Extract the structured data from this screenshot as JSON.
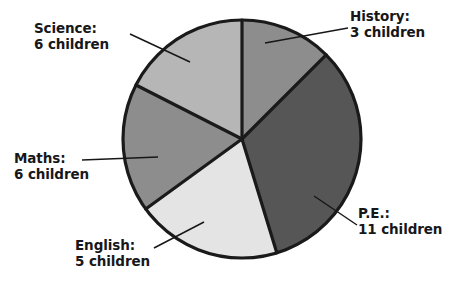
{
  "chart_data": {
    "type": "pie",
    "title": "",
    "unit": "children",
    "total": 31,
    "center": {
      "x": 242,
      "y": 139
    },
    "radius": 119,
    "start_angle_deg": 0,
    "direction": "clockwise",
    "legend_position": "outside-callouts",
    "grid": false,
    "categories": [
      "History",
      "P.E.",
      "English",
      "Maths",
      "Science"
    ],
    "values": [
      3,
      11,
      5,
      6,
      6
    ],
    "slices": [
      {
        "name": "History",
        "value": 3,
        "label_line1": "History:",
        "label_line2": "3 children",
        "color": "#8d8d8d",
        "start_deg": 0,
        "end_deg": 45
      },
      {
        "name": "P.E.",
        "value": 11,
        "label_line1": "P.E.:",
        "label_line2": "11 children",
        "color": "#565656",
        "start_deg": 45,
        "end_deg": 163
      },
      {
        "name": "English",
        "value": 5,
        "label_line1": "English:",
        "label_line2": "5 children",
        "color": "#e4e4e4",
        "start_deg": 163,
        "end_deg": 234
      },
      {
        "name": "Maths",
        "value": 6,
        "label_line1": "Maths:",
        "label_line2": "6 children",
        "color": "#8d8d8d",
        "start_deg": 234,
        "end_deg": 297
      },
      {
        "name": "Science",
        "value": 6,
        "label_line1": "Science:",
        "label_line2": "6 children",
        "color": "#b6b6b6",
        "start_deg": 297,
        "end_deg": 360
      }
    ],
    "outline_color": "#1a1a1a",
    "background_color": "#ffffff"
  }
}
